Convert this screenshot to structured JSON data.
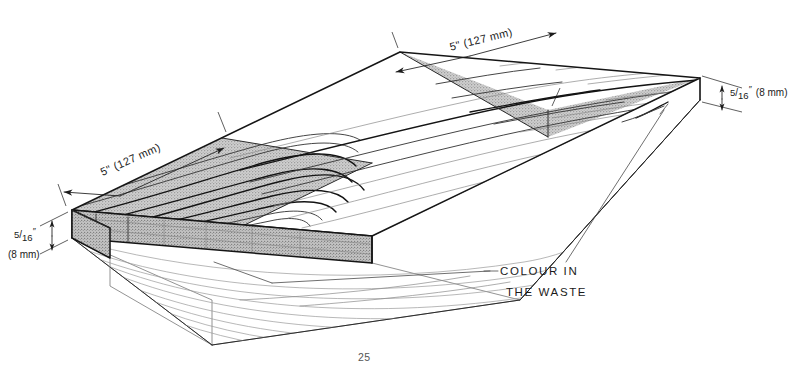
{
  "figure": {
    "page_number": "25"
  },
  "dimensions": {
    "width_near": {
      "imperial": "5\"",
      "metric": "(127 mm)",
      "full": "5\" (127 mm)"
    },
    "width_far": {
      "imperial": "5\"",
      "metric": "(127 mm)",
      "full": "5\" (127 mm)"
    },
    "thickness_left": {
      "numerator": "5",
      "denominator": "16",
      "inch_mark": "″",
      "metric": "(8 mm)"
    },
    "thickness_right": {
      "numerator": "5",
      "denominator": "16",
      "inch_mark": "″",
      "metric": "(8 mm)"
    }
  },
  "annotations": {
    "waste_callout": {
      "line1": "COLOUR IN",
      "line2": "THE WASTE"
    }
  },
  "colors": {
    "shaded_face": "#bdbdbd",
    "edge_face": "#a8a8a8",
    "outline": "#151515",
    "ghost": "#9a9a9a",
    "background": "#ffffff"
  }
}
